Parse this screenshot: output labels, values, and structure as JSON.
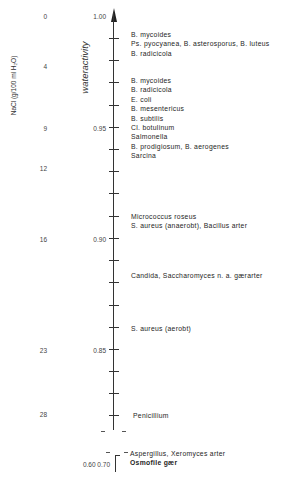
{
  "labels": {
    "nacl_axis_title": "NaCl  (g/100 ml H₂O)",
    "water_activity_title": "wateractivity"
  },
  "nacl_values": [
    {
      "value": "0",
      "y": 13
    },
    {
      "value": "4",
      "y": 63
    },
    {
      "value": "9",
      "y": 125
    },
    {
      "value": "12",
      "y": 165
    },
    {
      "value": "16",
      "y": 236
    },
    {
      "value": "23",
      "y": 347
    },
    {
      "value": "28",
      "y": 411
    }
  ],
  "aw_values": [
    {
      "value": "1.00",
      "y": 13
    },
    {
      "value": "0.95",
      "y": 125
    },
    {
      "value": "0.90",
      "y": 236
    },
    {
      "value": "0.85",
      "y": 347
    }
  ],
  "aw_bottom": "0.60  0.70",
  "organisms": {
    "group1": [
      "B.  mycoides",
      "Ps.  pyocyanea,  B. asterosporus,  B. luteus",
      "B.  radicicola"
    ],
    "group2": [
      "B.  mycoides",
      "B.  radicicola",
      "E.  coli",
      "B.  mesentericus",
      "B.  subtilis",
      "Cl.  botulinum",
      "Salmonella",
      "B.  prodigiosum,  B. aerogenes",
      "Sarcina"
    ],
    "group3": [
      "Micrococcus roseus",
      "S.  aureus (anaerobt),  Bacillus arter"
    ],
    "group4": [
      "Candida,  Saccharomyces  n. a.  gærarter"
    ],
    "group5": [
      "S.  aureus (aerobt)"
    ],
    "group6": [
      "Penicillium"
    ],
    "group7": [
      "Aspergillus,  Xeromyces arter",
      "Osmofile gær"
    ]
  },
  "colors": {
    "ink": "#2a2a2a",
    "paper": "#ffffff"
  }
}
